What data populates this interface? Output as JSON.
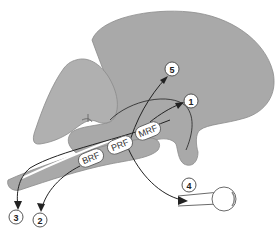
{
  "diagram": {
    "type": "anatomical schematic (brainstem reticular formation projections)",
    "regions": [
      {
        "id": "cerebrum",
        "label": ""
      },
      {
        "id": "cerebellum-left-lobe",
        "label": ""
      },
      {
        "id": "brainstem",
        "label": ""
      },
      {
        "id": "eye",
        "label": ""
      }
    ],
    "nuclei": [
      {
        "id": "brf",
        "label": "BRF"
      },
      {
        "id": "prf",
        "label": "PRF"
      },
      {
        "id": "mrf",
        "label": "MRF"
      }
    ],
    "targets": [
      {
        "id": "t1",
        "label": "1"
      },
      {
        "id": "t2",
        "label": "2"
      },
      {
        "id": "t3",
        "label": "3"
      },
      {
        "id": "t4",
        "label": "4"
      },
      {
        "id": "t5",
        "label": "5"
      }
    ],
    "colors": {
      "tissue": "#a9a9a9",
      "outline": "#444444",
      "background": "#ffffff"
    }
  }
}
